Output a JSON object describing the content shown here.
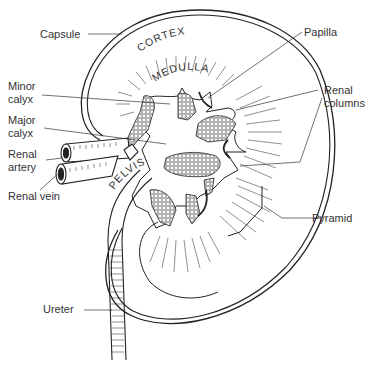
{
  "diagram": {
    "labels": {
      "capsule": "Capsule",
      "minor_calyx": "Minor\ncalyx",
      "major_calyx": "Major\ncalyx",
      "renal_artery": "Renal\nartery",
      "renal_vein": "Renal vein",
      "ureter": "Ureter",
      "papilla": "Papilla",
      "renal_columns": "Renal\ncolumns",
      "pyramid": "Pyramid"
    },
    "region_text": {
      "cortex": "CORTEX",
      "medulla": "MEDULLA",
      "pelvis": "PELVIS"
    },
    "colors": {
      "ink": "#222222",
      "background": "#ffffff"
    }
  }
}
